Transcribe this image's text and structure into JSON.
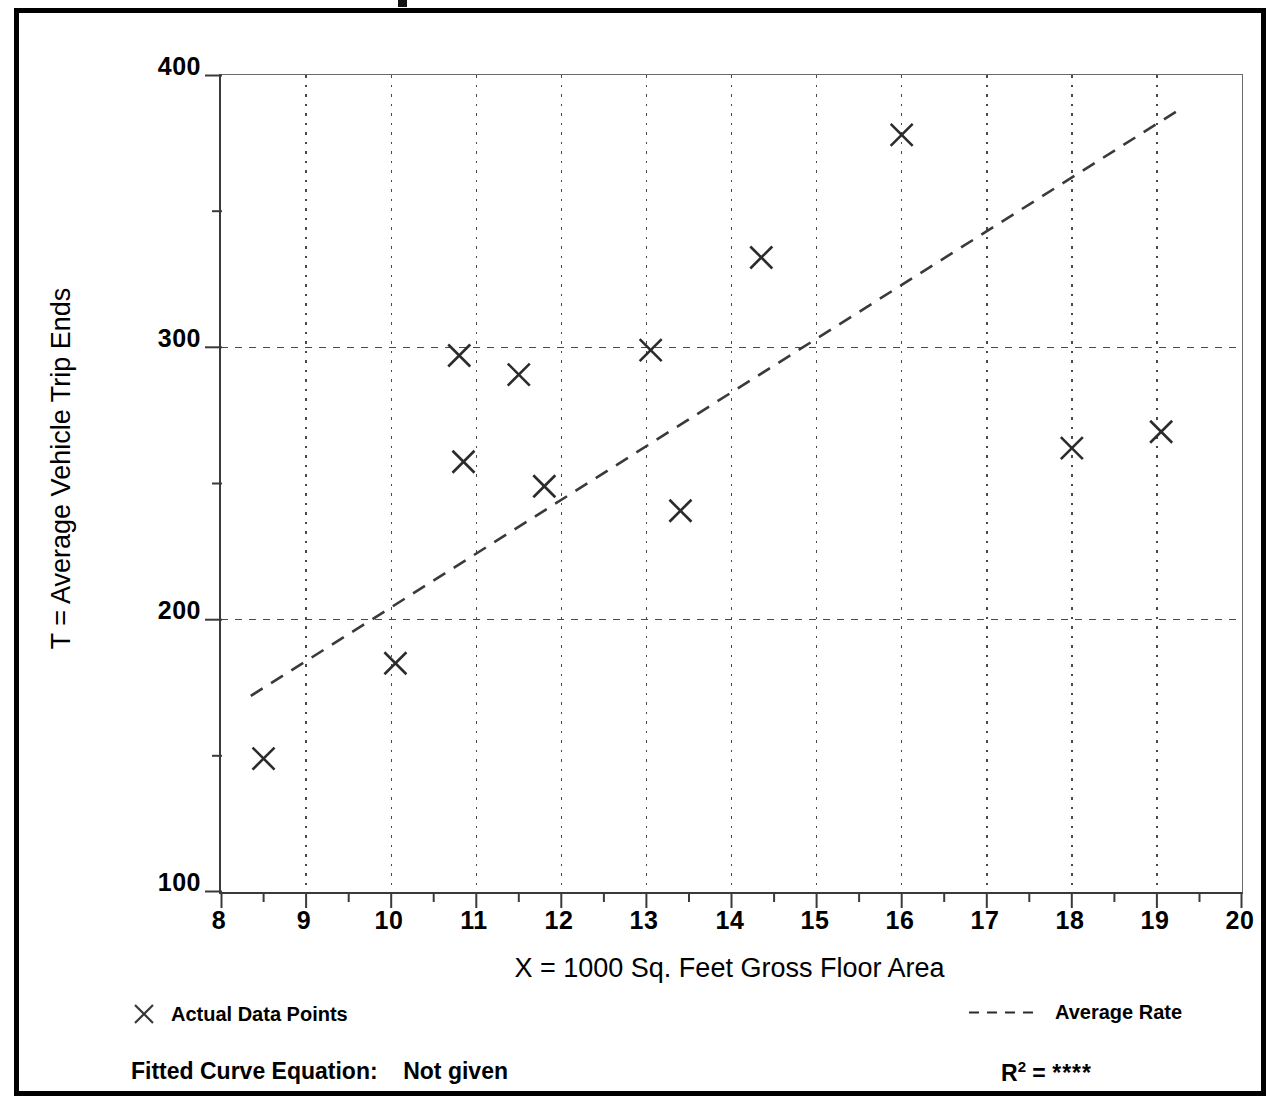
{
  "chart_data": {
    "type": "scatter",
    "title": "",
    "xlabel": "X = 1000 Sq. Feet Gross Floor Area",
    "ylabel": "T = Average Vehicle Trip Ends",
    "xlim": [
      8,
      20
    ],
    "ylim": [
      100,
      400
    ],
    "xticks": [
      8,
      9,
      10,
      11,
      12,
      13,
      14,
      15,
      16,
      17,
      18,
      19,
      20
    ],
    "xtick_labels": [
      "8",
      "9",
      "10",
      "11",
      "12",
      "13",
      "14",
      "15",
      "16",
      "17",
      "18",
      "19",
      "20"
    ],
    "yticks": [
      100,
      200,
      300,
      400
    ],
    "ytick_labels": [
      "100",
      "200",
      "300",
      "400"
    ],
    "y_minor_ticks": [
      150,
      250,
      350
    ],
    "grid": "dotted vertical at every x integer; dashed horizontal at 200 and 300",
    "legend_position": "below plot",
    "series": [
      {
        "name": "Actual Data Points",
        "type": "scatter",
        "marker": "x",
        "color": "#2b2b2b",
        "points": [
          {
            "x": 8.5,
            "y": 149
          },
          {
            "x": 10.05,
            "y": 184
          },
          {
            "x": 10.8,
            "y": 297
          },
          {
            "x": 10.85,
            "y": 258
          },
          {
            "x": 11.5,
            "y": 290
          },
          {
            "x": 11.8,
            "y": 249
          },
          {
            "x": 13.05,
            "y": 299
          },
          {
            "x": 13.4,
            "y": 240
          },
          {
            "x": 14.35,
            "y": 333
          },
          {
            "x": 16.0,
            "y": 378
          },
          {
            "x": 18.0,
            "y": 263
          },
          {
            "x": 19.05,
            "y": 269
          }
        ]
      },
      {
        "name": "Average Rate",
        "type": "line",
        "style": "dashed",
        "color": "#3a3a3a",
        "endpoints": [
          {
            "x": 8.35,
            "y": 172
          },
          {
            "x": 19.3,
            "y": 388
          }
        ]
      }
    ]
  },
  "axes": {
    "y_title": "T = Average Vehicle Trip Ends",
    "x_title": "X = 1000 Sq. Feet Gross Floor Area"
  },
  "legend": {
    "data_points_label": "Actual Data Points",
    "average_rate_label": "Average Rate",
    "marker_icon": "x-marker-icon",
    "line_icon": "dashed-line-icon"
  },
  "footer": {
    "equation_label": "Fitted Curve Equation:",
    "equation_value": "Not given",
    "r2_base": "R",
    "r2_exponent": "2",
    "r2_equals": "=",
    "r2_value": "****"
  },
  "colors": {
    "frame": "#000000",
    "axis": "#3a3a3a",
    "grid": "#4a4a4a",
    "marker": "#2b2b2b",
    "trend": "#3a3a3a"
  }
}
